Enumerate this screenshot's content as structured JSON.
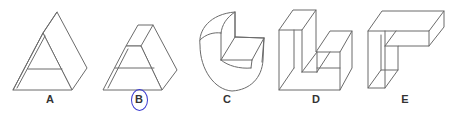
{
  "figure": {
    "type": "multiple-choice-3d-shapes",
    "options": [
      {
        "id": "A",
        "label": "A",
        "shape": "triangular prism",
        "label_x": 50,
        "selected": false
      },
      {
        "id": "B",
        "label": "B",
        "shape": "truncated triangular prism",
        "label_x": 139,
        "selected": true
      },
      {
        "id": "C",
        "label": "C",
        "shape": "cylinder with quarter notch",
        "label_x": 227,
        "selected": false
      },
      {
        "id": "D",
        "label": "D",
        "shape": "U-shaped block",
        "label_x": 316,
        "selected": false
      },
      {
        "id": "E",
        "label": "E",
        "shape": "L-shaped block",
        "label_x": 405,
        "selected": false
      }
    ],
    "selected_answer": "B",
    "colors": {
      "line": "#6b6b6b",
      "selection_circle": "#3a3ad0",
      "label": "#333333",
      "background": "#ffffff"
    }
  }
}
